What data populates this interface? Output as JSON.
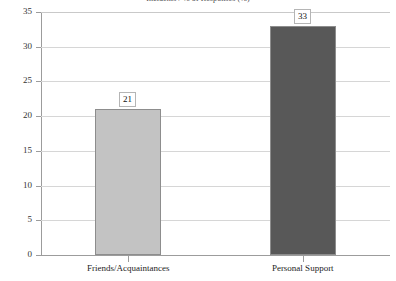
{
  "chart_data": {
    "type": "bar",
    "title": "Incidents / % of Responses (%)",
    "xlabel": "",
    "ylabel": "",
    "categories": [
      "Friends/Acquaintances",
      "Personal Support"
    ],
    "values": [
      21,
      33
    ],
    "data_labels": [
      "21",
      "33"
    ],
    "ylim": [
      0,
      35
    ],
    "yticks": [
      0,
      5,
      10,
      15,
      20,
      25,
      30,
      35
    ],
    "ytick_labels": [
      "0",
      "5",
      "10",
      "15",
      "20",
      "25",
      "30",
      "35"
    ],
    "grid": "horizontal",
    "legend": "none",
    "series": [
      {
        "name": "Responses",
        "values": [
          21,
          33
        ],
        "colors": [
          "#c3c3c3",
          "#585858"
        ]
      }
    ],
    "bar_colors": {
      "friends_acquaintances": "#c3c3c3",
      "personal_support": "#585858"
    },
    "axis_color": "#9c9c9c",
    "grid_color": "#d6d6d6"
  }
}
